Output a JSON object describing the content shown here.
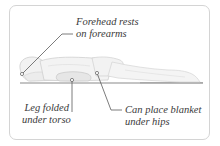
{
  "diagram": {
    "colors": {
      "card_border": "#d4d4d4",
      "leader_line": "#5a5a5a",
      "body_fill": "#f1f1f1",
      "body_outline": "#c8c8c8",
      "floor": "#b9b9b9",
      "label_text": "#3a3a3a"
    },
    "annotations": [
      {
        "id": "forehead",
        "lines": [
          "Forehead rests",
          "on forearms"
        ],
        "anchor": [
          22,
          74
        ]
      },
      {
        "id": "leg",
        "lines": [
          "Leg folded",
          "under torso"
        ],
        "anchor": [
          72,
          80
        ]
      },
      {
        "id": "blanket",
        "lines": [
          "Can place blanket",
          "under hips"
        ],
        "anchor": [
          97,
          73
        ]
      }
    ]
  }
}
